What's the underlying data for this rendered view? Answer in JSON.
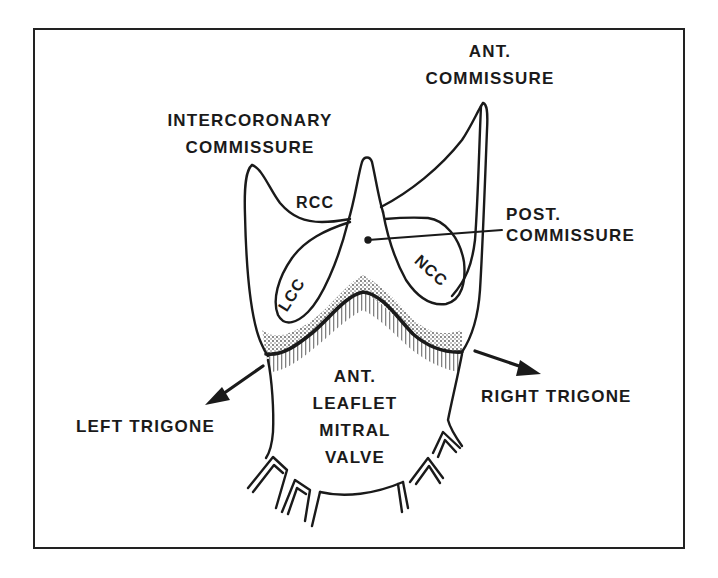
{
  "figure": {
    "line_color": "#1a1a1a",
    "background": "#ffffff",
    "labels": {
      "ant_commissure": [
        "ANT.",
        "COMMISSURE"
      ],
      "intercoronary_commissure": [
        "INTERCORONARY",
        "COMMISSURE"
      ],
      "post_commissure": [
        "POST.",
        "COMMISSURE"
      ],
      "rcc": "RCC",
      "lcc": "LCC",
      "ncc": "NCC",
      "ant_leaflet": [
        "ANT.",
        "LEAFLET",
        "MITRAL",
        "VALVE"
      ],
      "left_trigone": "LEFT TRIGONE",
      "right_trigone": "RIGHT TRIGONE"
    }
  }
}
